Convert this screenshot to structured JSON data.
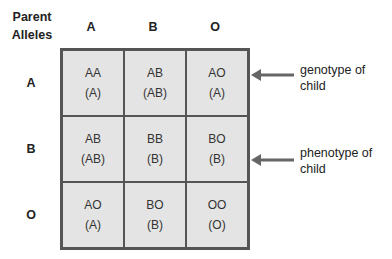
{
  "corner_label": [
    "Parent",
    "Alleles"
  ],
  "columns": [
    "A",
    "B",
    "O"
  ],
  "rows": [
    "A",
    "B",
    "O"
  ],
  "cells": [
    [
      {
        "genotype": "AA",
        "phenotype": "(A)"
      },
      {
        "genotype": "AB",
        "phenotype": "(AB)"
      },
      {
        "genotype": "AO",
        "phenotype": "(A)"
      }
    ],
    [
      {
        "genotype": "AB",
        "phenotype": "(AB)"
      },
      {
        "genotype": "BB",
        "phenotype": "(B)"
      },
      {
        "genotype": "BO",
        "phenotype": "(B)"
      }
    ],
    [
      {
        "genotype": "AO",
        "phenotype": "(A)"
      },
      {
        "genotype": "BO",
        "phenotype": "(B)"
      },
      {
        "genotype": "OO",
        "phenotype": "(O)"
      }
    ]
  ],
  "annotations": {
    "genotype": [
      "genotype of",
      "child"
    ],
    "phenotype": [
      "phenotype of",
      "child"
    ]
  },
  "colors": {
    "cell_fill": "#e4e4e4",
    "grid_line": "#555555",
    "arrow": "#666666"
  }
}
